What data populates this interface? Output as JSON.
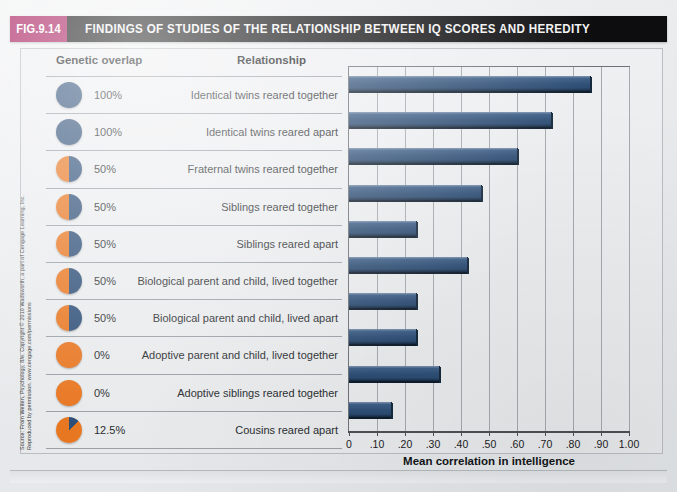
{
  "figure": {
    "number": "FIG.9.14",
    "title": "FINDINGS OF STUDIES OF THE RELATIONSHIP BETWEEN IQ SCORES AND HEREDITY"
  },
  "credit": {
    "line1": "Source: From Weiten, Psychology, 8/e. Copyright © 2010 Wadsworth, a part of Cengage Learning, Inc.",
    "line2": "Reproduced by permission. www.cengage.com/permissions"
  },
  "table": {
    "header_genetic": "Genetic overlap",
    "header_relationship": "Relationship"
  },
  "colors": {
    "accent_magenta": "#a6185a",
    "title_bar": "#0d0d0f",
    "bar_blue": "#2f4f76",
    "pie_blue": "#2e4f78",
    "pie_orange": "#e87722"
  },
  "chart_data": {
    "type": "bar",
    "orientation": "horizontal",
    "title": "FINDINGS OF STUDIES OF THE RELATIONSHIP BETWEEN IQ SCORES AND HEREDITY",
    "xlabel": "Mean correlation in intelligence",
    "ylabel": "",
    "xlim": [
      0,
      1.0
    ],
    "xticks": [
      0,
      0.1,
      0.2,
      0.3,
      0.4,
      0.5,
      0.6,
      0.7,
      0.8,
      0.9,
      1.0
    ],
    "xticklabels": [
      "0",
      ".10",
      ".20",
      ".30",
      ".40",
      ".50",
      ".60",
      ".70",
      ".80",
      ".90",
      "1.00"
    ],
    "grid": true,
    "legend": false,
    "categories": [
      "Identical twins reared together",
      "Identical twins reared apart",
      "Fraternal twins reared together",
      "Siblings reared together",
      "Siblings reared apart",
      "Biological parent and child, lived together",
      "Biological parent and child, lived apart",
      "Adoptive parent and child, lived together",
      "Adoptive siblings reared together",
      "Cousins reared apart"
    ],
    "genetic_overlap": [
      "100%",
      "100%",
      "50%",
      "50%",
      "50%",
      "50%",
      "50%",
      "0%",
      "0%",
      "12.5%"
    ],
    "genetic_overlap_fraction": [
      1.0,
      1.0,
      0.5,
      0.5,
      0.5,
      0.5,
      0.5,
      0.0,
      0.0,
      0.125
    ],
    "values": [
      0.86,
      0.72,
      0.6,
      0.47,
      0.24,
      0.42,
      0.24,
      0.24,
      0.32,
      0.15
    ]
  }
}
